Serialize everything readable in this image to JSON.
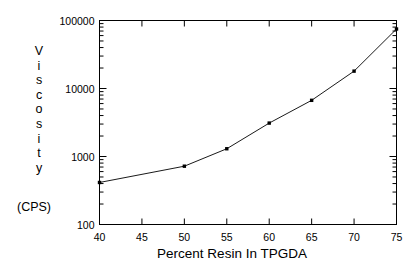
{
  "chart_data": {
    "type": "line",
    "title": "",
    "xlabel": "Percent Resin In TPGDA",
    "ylabel": "Viscosity",
    "yunits": "(CPS)",
    "yscale": "log",
    "xscale": "linear",
    "xlim": [
      40,
      75
    ],
    "ylim": [
      100,
      100000
    ],
    "grid": false,
    "legend": null,
    "marker": "square",
    "line_color": "#000000",
    "marker_color": "#000000",
    "background_color": "#ffffff",
    "xticks": [
      40,
      45,
      50,
      55,
      60,
      65,
      70,
      75
    ],
    "xtick_labels": [
      "40",
      "45",
      "50",
      "55",
      "60",
      "65",
      "70",
      "75"
    ],
    "yticks": [
      100,
      1000,
      10000,
      100000
    ],
    "ytick_labels": [
      "100",
      "1000",
      "10000",
      "100000"
    ],
    "y_minor_ticks": true,
    "x": [
      40,
      50,
      55,
      60,
      65,
      70,
      75
    ],
    "values": [
      415,
      720,
      1300,
      3100,
      6700,
      18000,
      75000
    ],
    "points": [
      {
        "x": 40,
        "y": 415
      },
      {
        "x": 50,
        "y": 720
      },
      {
        "x": 55,
        "y": 1300
      },
      {
        "x": 60,
        "y": 3100
      },
      {
        "x": 65,
        "y": 6700
      },
      {
        "x": 70,
        "y": 18000
      },
      {
        "x": 75,
        "y": 75000
      }
    ],
    "series": [
      {
        "name": "Viscosity",
        "x": [
          40,
          50,
          55,
          60,
          65,
          70,
          75
        ],
        "values": [
          415,
          720,
          1300,
          3100,
          6700,
          18000,
          75000
        ]
      }
    ]
  },
  "ylabel_letters": [
    "V",
    "i",
    "s",
    "c",
    "o",
    "s",
    "i",
    "t",
    "y"
  ]
}
